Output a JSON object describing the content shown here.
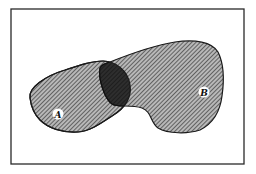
{
  "diagram": {
    "type": "venn",
    "frame": {
      "x": 11,
      "y": 9,
      "width": 233,
      "height": 155,
      "stroke": "#2a2a2a"
    },
    "sets": [
      {
        "id": "A",
        "label": "A",
        "fill_pattern": "diagonal-hatch",
        "fill": "#8a8a8a",
        "label_pos": [
          58,
          114
        ]
      },
      {
        "id": "B",
        "label": "B",
        "fill_pattern": "diagonal-hatch",
        "fill": "#8a8a8a",
        "label_pos": [
          204,
          92
        ]
      }
    ],
    "intersection": {
      "sets": [
        "A",
        "B"
      ],
      "fill": "#3a3a3a"
    },
    "colors": {
      "outline": "#1a1a1a",
      "hatch_dark": "#555555",
      "hatch_light": "#b5b5b5",
      "label_bg": "#ffffff"
    }
  }
}
